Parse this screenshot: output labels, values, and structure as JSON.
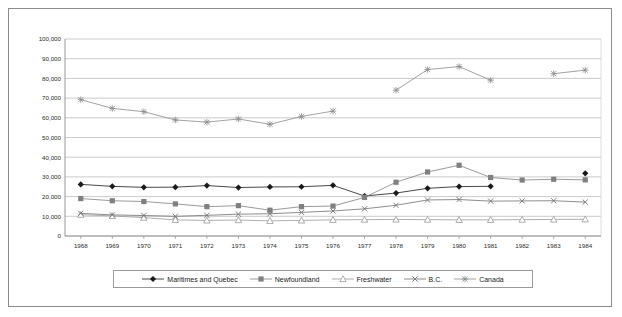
{
  "chart_data": {
    "type": "line",
    "title": "",
    "subtitle": "",
    "xlabel": "",
    "ylabel": "",
    "categories": [
      "1968",
      "1969",
      "1970",
      "1971",
      "1972",
      "1973",
      "1974",
      "1975",
      "1976",
      "1977",
      "1978",
      "1979",
      "1980",
      "1981",
      "1982",
      "1983",
      "1984"
    ],
    "ylim": [
      0,
      100000
    ],
    "ytick_values": [
      0,
      10000,
      20000,
      30000,
      40000,
      50000,
      60000,
      70000,
      80000,
      90000,
      100000
    ],
    "ytick_labels": [
      "0",
      "10,000",
      "20,000",
      "30,000",
      "40,000",
      "50,000",
      "60,000",
      "70,000",
      "80,000",
      "90,000",
      "100,000"
    ],
    "grid": "horizontal",
    "legend_position": "bottom",
    "series": [
      {
        "name": "Maritimes and Quebec",
        "marker": "filled-diamond",
        "color": "#1a1a1a",
        "values": [
          26200,
          25200,
          24700,
          24800,
          25600,
          24600,
          24900,
          25000,
          25700,
          20300,
          21800,
          24200,
          25100,
          25200,
          null,
          null,
          31800
        ]
      },
      {
        "name": "Newfoundland",
        "marker": "filled-square",
        "color": "#808080",
        "values": [
          19000,
          17900,
          17500,
          16300,
          14900,
          15400,
          13100,
          14900,
          15200,
          19600,
          27300,
          32500,
          35900,
          29700,
          28400,
          28800,
          28500
        ]
      },
      {
        "name": "Freshwater",
        "marker": "open-triangle",
        "color": "#9a9a9a",
        "values": [
          10800,
          10200,
          9300,
          8200,
          7900,
          8100,
          7700,
          7900,
          8200,
          8300,
          8400,
          8300,
          8200,
          8200,
          8300,
          8400,
          8500
        ]
      },
      {
        "name": "B.C.",
        "marker": "cross-x",
        "color": "#707070",
        "values": [
          11500,
          10700,
          10400,
          10000,
          10500,
          11100,
          11300,
          12000,
          12700,
          13800,
          15600,
          18300,
          18500,
          17700,
          17800,
          17900,
          17200
        ]
      },
      {
        "name": "Canada",
        "marker": "asterisk",
        "color": "#8a8a8a",
        "values": [
          69200,
          64800,
          63100,
          58900,
          57800,
          59400,
          56700,
          60700,
          63400,
          null,
          74000,
          84500,
          86000,
          79100,
          null,
          82400,
          84200
        ]
      }
    ]
  },
  "legend": {
    "items": [
      {
        "label": "Maritimes and Quebec"
      },
      {
        "label": "Newfoundland"
      },
      {
        "label": "Freshwater"
      },
      {
        "label": "B.C."
      },
      {
        "label": "Canada"
      }
    ]
  }
}
